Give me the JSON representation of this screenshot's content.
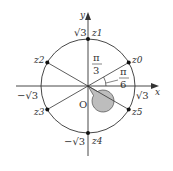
{
  "diagram": {
    "axes": {
      "x_label": "x",
      "y_label": "y",
      "origin_label": "O"
    },
    "radius_labels": {
      "pos_x": "√3",
      "neg_x": "−√3",
      "pos_y": "√3",
      "neg_y": "−√3"
    },
    "points": [
      {
        "label": "z0",
        "name": "z",
        "sub": "0",
        "angle_deg": 30
      },
      {
        "label": "z1",
        "name": "z",
        "sub": "1",
        "angle_deg": 90
      },
      {
        "label": "z2",
        "name": "z",
        "sub": "2",
        "angle_deg": 150
      },
      {
        "label": "z3",
        "name": "z",
        "sub": "3",
        "angle_deg": 210
      },
      {
        "label": "z4",
        "name": "z",
        "sub": "4",
        "angle_deg": 270
      },
      {
        "label": "z5",
        "name": "z",
        "sub": "5",
        "angle_deg": 330
      }
    ],
    "angles": [
      {
        "label": "π/3",
        "num": "π",
        "den": "3"
      },
      {
        "label": "π/6",
        "num": "π",
        "den": "6"
      }
    ]
  }
}
